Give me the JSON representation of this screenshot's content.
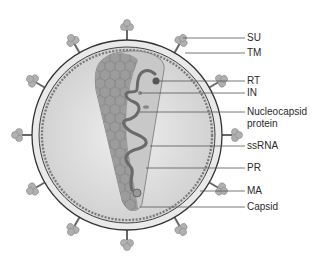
{
  "diagram": {
    "labels": [
      {
        "id": "su",
        "text": "SU",
        "y": 38
      },
      {
        "id": "tm",
        "text": "TM",
        "y": 53
      },
      {
        "id": "rt",
        "text": "RT",
        "y": 81
      },
      {
        "id": "in",
        "text": "IN",
        "y": 93
      },
      {
        "id": "nucleocapsid",
        "text": "Nucleocapsid",
        "text2": "protein",
        "y": 112
      },
      {
        "id": "ssrna",
        "text": "ssRNA",
        "y": 146
      },
      {
        "id": "pr",
        "text": "PR",
        "y": 168
      },
      {
        "id": "ma",
        "text": "MA",
        "y": 191
      },
      {
        "id": "capsid",
        "text": "Capsid",
        "y": 207
      }
    ],
    "colors": {
      "envelope_outline": "#3a3a3a",
      "envelope_fill": "#e8e8e8",
      "interior": "#d6d6d6",
      "capsid_fill": "#9a9a9a",
      "capsid_light": "#c4c4c4",
      "rna": "#666666",
      "leader_line": "#555555",
      "spike": "#a8a8a8"
    }
  }
}
